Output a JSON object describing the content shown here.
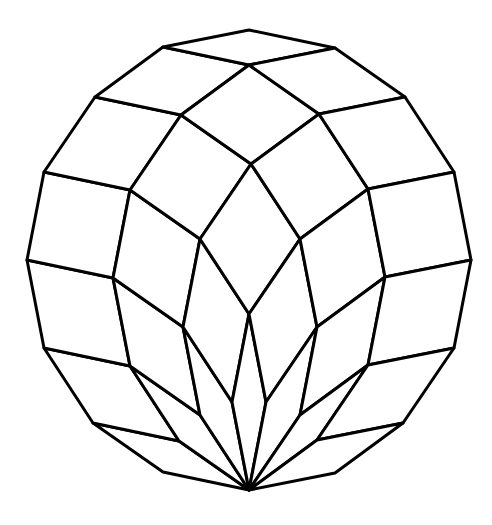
{
  "figure": {
    "stroke_color": "#000000",
    "background_color": "#ffffff",
    "stroke_width": 3,
    "bottom_vertex": [
      249,
      490
    ],
    "edge_vectors": [
      [
        -86,
        -18
      ],
      [
        -70,
        -49
      ],
      [
        -49,
        -75
      ],
      [
        -17,
        -88
      ],
      [
        17,
        -88
      ],
      [
        51,
        -75
      ],
      [
        68,
        -50
      ],
      [
        86,
        -17
      ]
    ]
  }
}
